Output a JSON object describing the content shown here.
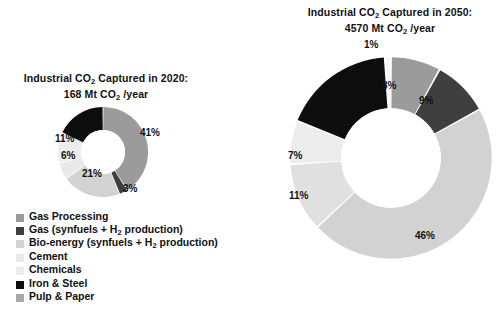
{
  "chart_data": [
    {
      "type": "pie",
      "id": "co2-2020",
      "title": "Industrial CO2 Captured in 2020:",
      "subtitle": "168 Mt CO2 /year",
      "title_line1_pre": "Industrial CO",
      "title_line1_sub": "2",
      "title_line1_post": " Captured in 2020:",
      "title_line2_pre": "168 Mt CO",
      "title_line2_sub": "2",
      "title_line2_post": " /year",
      "total_value": 168,
      "total_units": "Mt CO2/year",
      "donut": true,
      "legend_position": "bottom-left",
      "categories": [
        "Gas Processing",
        "Gas (synfuels + H2 production)",
        "Bio-energy (synfuels + H2 production)",
        "Cement",
        "Chemicals",
        "Iron & Steel",
        "Pulp & Paper"
      ],
      "values": [
        41,
        3,
        21,
        6,
        11,
        18,
        0
      ],
      "colors": [
        "#9b9b9b",
        "#3f3f3f",
        "#d2d2d2",
        "#e9e9e9",
        "#ededed",
        "#0d0d0d",
        "#a8a8a8"
      ],
      "labels_shown": [
        "41%",
        "3%",
        "21%",
        "6%",
        "11%"
      ],
      "slice_labels": [
        {
          "text": "41%",
          "x": 147,
          "y": 134
        },
        {
          "text": "3%",
          "x": 124,
          "y": 183
        },
        {
          "text": "21%",
          "x": 85,
          "y": 171
        },
        {
          "text": "6%",
          "x": 64,
          "y": 155
        },
        {
          "text": "11%",
          "x": 60,
          "y": 138
        }
      ]
    },
    {
      "type": "pie",
      "id": "co2-2050",
      "title": "Industrial CO2 Captured in 2050:",
      "subtitle": "4570 Mt CO2 /year",
      "title_line1_pre": "Industrial CO",
      "title_line1_sub": "2",
      "title_line1_post": " Captured in 2050:",
      "title_line2_pre": "4570 Mt CO",
      "title_line2_sub": "2",
      "title_line2_post": " /year",
      "total_value": 4570,
      "total_units": "Mt CO2/year",
      "donut": true,
      "categories": [
        "Gas Processing",
        "Gas (synfuels + H2 production)",
        "Bio-energy (synfuels + H2 production)",
        "Cement",
        "Chemicals",
        "Iron & Steel",
        "Pulp & Paper"
      ],
      "values": [
        8,
        9,
        46,
        11,
        7,
        18,
        1
      ],
      "colors": [
        "#9b9b9b",
        "#3f3f3f",
        "#d2d2d2",
        "#e0e0e0",
        "#ededed",
        "#0d0d0d",
        "#f7f7f7"
      ],
      "labels_shown": [
        "8%",
        "9%",
        "46%",
        "11%",
        "7%",
        "1%"
      ],
      "slice_labels": [
        {
          "text": "1%",
          "x": 368,
          "y": 43
        },
        {
          "text": "8%",
          "x": 386,
          "y": 85
        },
        {
          "text": "9%",
          "x": 424,
          "y": 100
        },
        {
          "text": "46%",
          "x": 421,
          "y": 236
        },
        {
          "text": "11%",
          "x": 294,
          "y": 195
        },
        {
          "text": "7%",
          "x": 292,
          "y": 155
        }
      ]
    }
  ],
  "legend": {
    "items": [
      {
        "label_pre": "Gas Processing",
        "label_sub": "",
        "label_post": "",
        "color": "#9b9b9b",
        "name": "gas-processing"
      },
      {
        "label_pre": "Gas (synfuels + H",
        "label_sub": "2",
        "label_post": " production)",
        "color": "#3f3f3f",
        "name": "gas-synfuels"
      },
      {
        "label_pre": "Bio-energy (synfuels + H",
        "label_sub": "2",
        "label_post": "  production)",
        "color": "#d2d2d2",
        "name": "bio-energy"
      },
      {
        "label_pre": "Cement",
        "label_sub": "",
        "label_post": "",
        "color": "#e9e9e9",
        "name": "cement"
      },
      {
        "label_pre": "Chemicals",
        "label_sub": "",
        "label_post": "",
        "color": "#ededed",
        "name": "chemicals"
      },
      {
        "label_pre": "Iron & Steel",
        "label_sub": "",
        "label_post": "",
        "color": "#0d0d0d",
        "name": "iron-steel"
      },
      {
        "label_pre": "Pulp & Paper",
        "label_sub": "",
        "label_post": "",
        "color": "#a8a8a8",
        "name": "pulp-paper"
      }
    ]
  }
}
